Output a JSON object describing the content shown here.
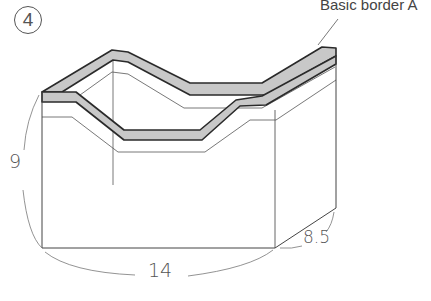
{
  "figure": {
    "step_number": "4",
    "callout_label": "Basic border A",
    "dimensions": {
      "height": "9",
      "width": "14",
      "depth": "8.5"
    }
  },
  "colors": {
    "line": "#2a2a2a",
    "thin_line": "#555555",
    "border_fill": "#c8c8c8",
    "background": "#ffffff"
  }
}
